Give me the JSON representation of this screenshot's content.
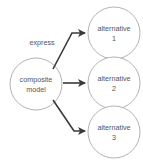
{
  "diagram": {
    "type": "node-link-diagram",
    "background_color": "#ffffff",
    "node_stroke_color": "#b4b4b4",
    "edge_color": "#3a3a3a",
    "text_color": "#555555",
    "source_node": {
      "id": "composite-model",
      "label_line1": "composite",
      "label_line2": "model",
      "shape": "circle",
      "cx": 36,
      "cy": 84,
      "r": 26
    },
    "target_nodes": [
      {
        "id": "alternative-1",
        "label_line1": "alternative",
        "label_line2": "1",
        "shape": "circle",
        "cx": 114,
        "cy": 33,
        "r": 26
      },
      {
        "id": "alternative-2",
        "label_line1": "alternative",
        "label_line2": "2",
        "shape": "circle",
        "cx": 114,
        "cy": 83,
        "r": 26
      },
      {
        "id": "alternative-3",
        "label_line1": "alternative",
        "label_line2": "3",
        "shape": "circle",
        "cx": 114,
        "cy": 132,
        "r": 26
      }
    ],
    "edges": [
      {
        "id": "edge-1",
        "from": "composite-model",
        "to": "alternative-1",
        "label": "express",
        "label_x": 42,
        "label_y": 43,
        "path": "M 53 69 L 72 33 L 85 33"
      },
      {
        "id": "edge-2",
        "from": "composite-model",
        "to": "alternative-2",
        "label": "",
        "path": "M 63 83 L 85 83"
      },
      {
        "id": "edge-3",
        "from": "composite-model",
        "to": "alternative-3",
        "label": "",
        "path": "M 53 100 L 74 131 L 85 131"
      }
    ],
    "arrowheads": [
      {
        "id": "arrowhead-1",
        "points": "86,33 78,29 80,33 78,37"
      },
      {
        "id": "arrowhead-2",
        "points": "86,83 78,79 80,83 78,87"
      },
      {
        "id": "arrowhead-3",
        "points": "86,131 78,127 80,131 78,135"
      }
    ]
  }
}
